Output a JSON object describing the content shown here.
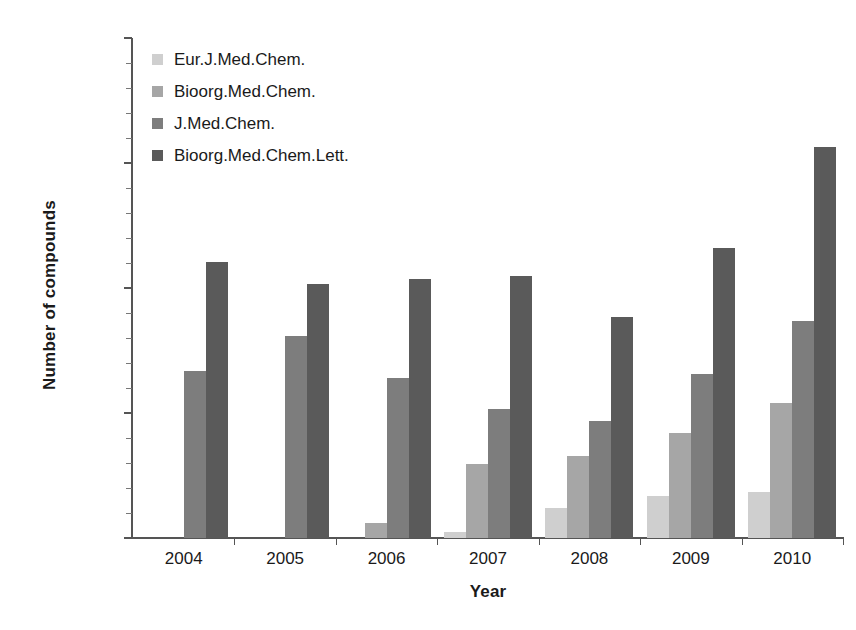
{
  "chart_data": {
    "type": "bar",
    "title": "",
    "xlabel": "Year",
    "ylabel": "Number of compounds",
    "categories": [
      "2004",
      "2005",
      "2006",
      "2007",
      "2008",
      "2009",
      "2010"
    ],
    "ylim": [
      0,
      20000
    ],
    "ytick_labels": [
      "0",
      "5000",
      "10000",
      "15000",
      "20000"
    ],
    "ytick_values": [
      0,
      5000,
      10000,
      15000,
      20000
    ],
    "ytick_minor_step": 1000,
    "grid": false,
    "legend_position": "top-left inside plot",
    "series": [
      {
        "name": "Eur.J.Med.Chem.",
        "color": "#cfcfcf",
        "values": [
          0,
          0,
          0,
          250,
          1200,
          1700,
          1850
        ]
      },
      {
        "name": "Bioorg.Med.Chem.",
        "color": "#a6a6a6",
        "values": [
          0,
          0,
          620,
          2950,
          3300,
          4200,
          5400
        ]
      },
      {
        "name": "J.Med.Chem.",
        "color": "#7d7d7d",
        "values": [
          6700,
          8100,
          6400,
          5150,
          4700,
          6550,
          8700
        ]
      },
      {
        "name": "Bioorg.Med.Chem.Lett.",
        "color": "#5a5a5a",
        "values": [
          11050,
          10150,
          10350,
          10500,
          8850,
          11600,
          15650
        ]
      }
    ]
  },
  "axis": {
    "axis_color": "#555555"
  }
}
